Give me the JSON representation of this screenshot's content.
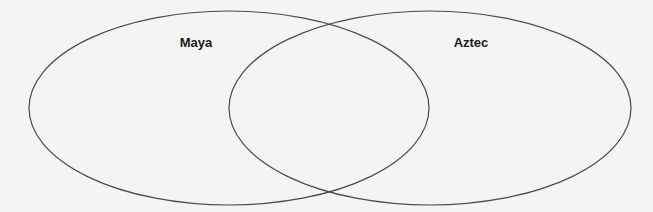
{
  "diagram": {
    "type": "venn",
    "sets": [
      {
        "id": "maya",
        "label": "Maya",
        "cx": 229,
        "cy": 108,
        "rx": 200,
        "ry": 97,
        "label_x": 196,
        "label_y": 35
      },
      {
        "id": "aztec",
        "label": "Aztec",
        "cx": 430,
        "cy": 108,
        "rx": 201,
        "ry": 97,
        "label_x": 471,
        "label_y": 35
      }
    ],
    "stroke_color": "#4a4a4a",
    "background_color": "#f4f4f2"
  }
}
